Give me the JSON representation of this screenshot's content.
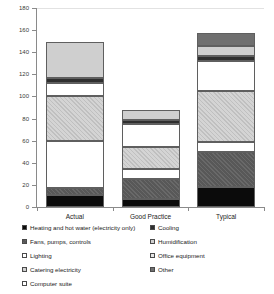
{
  "chart_data": {
    "type": "bar",
    "subtype": "stacked-column",
    "title": "",
    "xlabel": "",
    "ylabel": "",
    "ylim": [
      0,
      180
    ],
    "ytick_step": 20,
    "ytick_labels": [
      "0",
      "20",
      "40",
      "60",
      "80",
      "100",
      "120",
      "140",
      "160",
      "180"
    ],
    "grid": false,
    "legend_position": "bottom",
    "categories": [
      "Actual",
      "Good Practice",
      "Typical"
    ],
    "series": [
      {
        "name": "Heating and hot water (electricity only)",
        "key": "heating",
        "swatch": "#0b0b0b",
        "values": [
          11,
          7,
          18
        ]
      },
      {
        "name": "Fans, pumps, controls",
        "key": "fans",
        "swatch": "#585858",
        "values": [
          6,
          18,
          32
        ]
      },
      {
        "name": "Lighting",
        "key": "lighting",
        "swatch": "#ffffff",
        "values": [
          43,
          9,
          9
        ]
      },
      {
        "name": "Catering electricity",
        "key": "catering",
        "swatch": "#d4d4d4",
        "values": [
          40,
          20,
          46
        ]
      },
      {
        "name": "Computer suite",
        "key": "computer",
        "swatch": "#ffffff",
        "values": [
          12,
          21,
          27
        ]
      },
      {
        "name": "Cooling",
        "key": "cooling",
        "swatch": "#2f2f2f",
        "values": [
          5,
          4,
          5
        ]
      },
      {
        "name": "Humidification",
        "key": "humid",
        "swatch": "#cfcfcf",
        "values": [
          32,
          9,
          9
        ]
      },
      {
        "name": "Office equipment",
        "key": "office",
        "swatch": "#e6e6e6",
        "values": [
          0,
          0,
          0
        ]
      },
      {
        "name": "Other",
        "key": "other",
        "swatch": "#6f6f6f",
        "values": [
          0,
          0,
          11
        ]
      }
    ],
    "totals": [
      149,
      88,
      157
    ]
  },
  "axis": {
    "ticks": [
      {
        "label": "180"
      },
      {
        "label": "160"
      },
      {
        "label": "140"
      },
      {
        "label": "120"
      },
      {
        "label": "100"
      },
      {
        "label": "80"
      },
      {
        "label": "60"
      },
      {
        "label": "40"
      },
      {
        "label": "20"
      },
      {
        "label": "0"
      }
    ]
  },
  "categories": [
    {
      "label": "Actual"
    },
    {
      "label": "Good Practice"
    },
    {
      "label": "Typical"
    }
  ],
  "legend": {
    "left_column": [
      {
        "label": "Heating and hot water (electricity only)",
        "key": "heating"
      },
      {
        "label": "Fans, pumps, controls",
        "key": "fans"
      },
      {
        "label": "Lighting",
        "key": "lighting"
      },
      {
        "label": "Catering electricity",
        "key": "catering"
      },
      {
        "label": "Computer suite",
        "key": "computer"
      }
    ],
    "right_column": [
      {
        "label": "Cooling",
        "key": "cooling"
      },
      {
        "label": "Humidification",
        "key": "humid"
      },
      {
        "label": "Office equipment",
        "key": "office"
      },
      {
        "label": "Other",
        "key": "other"
      }
    ]
  }
}
